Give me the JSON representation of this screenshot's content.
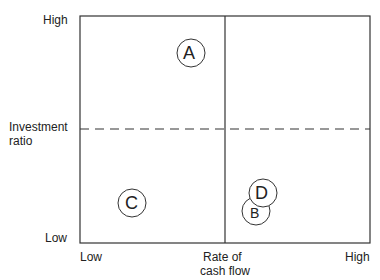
{
  "diagram": {
    "y_axis": {
      "high": "High",
      "low": "Low",
      "title_line1": "Investment",
      "title_line2": "ratio"
    },
    "x_axis": {
      "low": "Low",
      "high": "High",
      "title_line1": "Rate of",
      "title_line2": "cash flow"
    },
    "points": [
      {
        "label": "A",
        "quadrant": "top-left"
      },
      {
        "label": "C",
        "quadrant": "bottom-left"
      },
      {
        "label": "B",
        "quadrant": "bottom-right"
      },
      {
        "label": "D",
        "quadrant": "bottom-right"
      }
    ]
  }
}
